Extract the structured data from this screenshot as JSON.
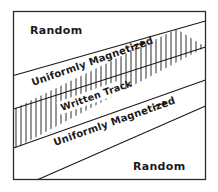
{
  "figure": {
    "background_color": "#ffffff",
    "ink_color": "#1a1a1a",
    "frame_color": "#2b2b2b",
    "labels": {
      "random_top": "Random",
      "random_bottom": "Random",
      "uniformly_magnetized_top": "Uniformly Magnetized",
      "uniformly_magnetized_bottom": "Uniformly Magnetized",
      "written_track": "Written Track"
    },
    "icons": {
      "arrow_top": "arrow-right-icon",
      "arrow_bottom": "arrow-right-icon"
    },
    "geometry": {
      "frame": {
        "x": 13,
        "y": 11,
        "width": 193,
        "height": 169
      },
      "band_angle_deg": -26,
      "hatch_spacing_px": 5,
      "hatch_orientation": "vertical"
    }
  }
}
